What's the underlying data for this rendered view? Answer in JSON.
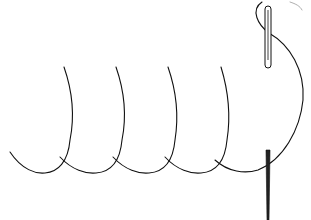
{
  "diagram": {
    "stroke_color": "#111111",
    "background": "#ffffff",
    "loops": [
      {
        "top_x": 64,
        "top_y": 67,
        "bottom_left_x": 10,
        "join_x": 60
      },
      {
        "top_x": 116,
        "top_y": 67,
        "join_x": 113
      },
      {
        "top_x": 168,
        "top_y": 67,
        "join_x": 165
      },
      {
        "top_x": 221,
        "top_y": 67,
        "join_x": 215
      }
    ],
    "needles": [
      {
        "name": "upper-needle",
        "x": 268,
        "y_top": 6,
        "y_bottom": 68
      },
      {
        "name": "lower-needle",
        "x": 268,
        "y_top": 150,
        "y_bottom": 220
      }
    ],
    "caption": ""
  }
}
